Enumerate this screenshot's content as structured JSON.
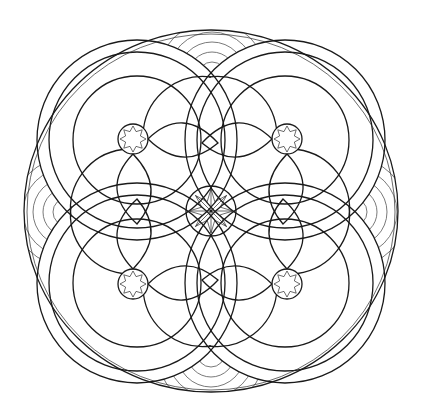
{
  "artwork": {
    "type": "mandala-line-drawing",
    "background": "#ffffff",
    "stroke_color": "#1a1a1a",
    "light_stroke_color": "#6a6a6a",
    "outer_border": {
      "cx": 211,
      "cy": 211,
      "rx": 187,
      "ry": 181
    },
    "center_rosette": {
      "cx": 211,
      "cy": 211,
      "r": 25,
      "points": 8
    },
    "quadrant_stars": [
      {
        "name": "upper-left",
        "cx": 133,
        "cy": 139,
        "r": 15,
        "points": 8
      },
      {
        "name": "upper-right",
        "cx": 287,
        "cy": 139,
        "r": 15,
        "points": 8
      },
      {
        "name": "lower-left",
        "cx": 133,
        "cy": 284,
        "r": 15,
        "points": 8
      },
      {
        "name": "lower-right",
        "cx": 287,
        "cy": 284,
        "r": 15,
        "points": 8
      }
    ],
    "ring_bands": [
      {
        "name": "upper-left",
        "cx": 137,
        "cy": 140,
        "r_outer": 100,
        "r_inner": 88
      },
      {
        "name": "upper-right",
        "cx": 285,
        "cy": 140,
        "r_outer": 100,
        "r_inner": 88
      },
      {
        "name": "lower-left",
        "cx": 137,
        "cy": 283,
        "r_outer": 100,
        "r_inner": 88
      },
      {
        "name": "lower-right",
        "cx": 285,
        "cy": 283,
        "r_outer": 100,
        "r_inner": 88
      }
    ],
    "concentric_arc_groups": [
      {
        "name": "top",
        "cx": 212,
        "cy": 76,
        "count": 5
      },
      {
        "name": "bottom",
        "cx": 211,
        "cy": 353,
        "count": 5
      },
      {
        "name": "left",
        "cx": 67,
        "cy": 212,
        "count": 5
      },
      {
        "name": "right",
        "cx": 353,
        "cy": 212,
        "count": 5
      }
    ]
  }
}
